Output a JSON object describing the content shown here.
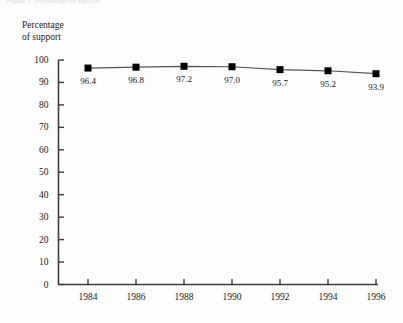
{
  "figure": {
    "clipped_caption": "Figure 1. Percentage of support",
    "axis_title_line1": "Percentage",
    "axis_title_line2": "of support"
  },
  "chart_data": {
    "type": "line",
    "title": "",
    "xlabel": "",
    "ylabel": "Percentage of support",
    "categories": [
      "1984",
      "1986",
      "1988",
      "1990",
      "1992",
      "1994",
      "1996"
    ],
    "values": [
      96.4,
      96.8,
      97.2,
      97.0,
      95.7,
      95.2,
      93.9
    ],
    "point_labels": [
      "96.4",
      "96.8",
      "97.2",
      "97.0",
      "95.7",
      "95.2",
      "93.9"
    ],
    "ylim": [
      0,
      100
    ],
    "ytick_labels": [
      "100",
      "90",
      "80",
      "70",
      "60",
      "50",
      "40",
      "30",
      "20",
      "10",
      "0"
    ],
    "ytick_values": [
      100,
      90,
      80,
      70,
      60,
      50,
      40,
      30,
      20,
      10,
      0
    ],
    "grid": false,
    "legend": "none",
    "marker": "filled-square",
    "marker_color": "#000000",
    "line_color": "#555555",
    "axis_color": "#3c3c3c",
    "background": "#fdfdfd"
  }
}
